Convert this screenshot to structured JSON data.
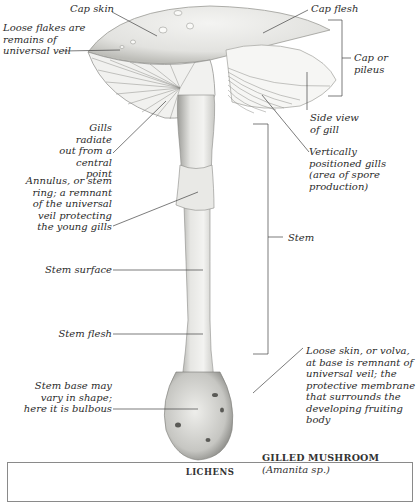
{
  "diagram": {
    "title": "GILLED MUSHROOM",
    "subtitle": "(Amanita sp.)",
    "labels": {
      "cap_skin": "Cap skin",
      "loose_flakes": "Loose flakes are\nremains of\nuniversal veil",
      "cap_flesh": "Cap flesh",
      "cap_or_pileus": "Cap or\npileus",
      "side_view_gill": "Side view\nof gill",
      "gills_radiate": "Gills radiate\nout from a\ncentral point",
      "vertical_gills": "Vertically\npositioned gills\n(area of spore\nproduction)",
      "annulus": "Annulus, or stem\nring; a remnant\nof the universal\nveil protecting\nthe young gills",
      "stem": "Stem",
      "stem_surface": "Stem surface",
      "stem_flesh": "Stem flesh",
      "volva": "Loose skin, or volva,\nat base is remnant of\nuniversal veil; the\nprotective membrane\nthat surrounds the\ndeveloping fruiting body",
      "stem_base": "Stem base may\nvary in shape;\nhere it is bulbous"
    }
  },
  "next_section": {
    "title": "LICHENS"
  }
}
